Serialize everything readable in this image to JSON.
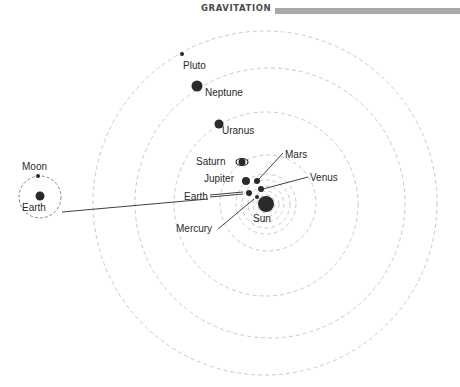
{
  "header": {
    "title": "GRAVITATION"
  },
  "diagram": {
    "sun": {
      "label": "Sun",
      "cx": 266,
      "cy": 204,
      "r": 8
    },
    "orbits": [
      {
        "name": "mercury-orbit",
        "cx": 266,
        "cy": 204,
        "r": 9
      },
      {
        "name": "venus-orbit",
        "cx": 266,
        "cy": 204,
        "r": 13
      },
      {
        "name": "earth-orbit",
        "cx": 266,
        "cy": 204,
        "r": 18
      },
      {
        "name": "mars-orbit",
        "cx": 266,
        "cy": 204,
        "r": 24
      },
      {
        "name": "jupiter-orbit",
        "cx": 266,
        "cy": 204,
        "r": 30
      },
      {
        "name": "saturn-orbit",
        "cx": 268,
        "cy": 203,
        "r": 48
      },
      {
        "name": "uranus-orbit",
        "cx": 266,
        "cy": 204,
        "r": 92
      },
      {
        "name": "neptune-orbit",
        "cx": 270,
        "cy": 203,
        "r": 135
      },
      {
        "name": "pluto-orbit",
        "cx": 265,
        "cy": 203,
        "r": 172
      }
    ],
    "planets": [
      {
        "label": "Mercury",
        "cx": 257,
        "cy": 197,
        "r": 2
      },
      {
        "label": "Venus",
        "cx": 261,
        "cy": 189,
        "r": 3
      },
      {
        "label": "Earth",
        "cx": 249,
        "cy": 193,
        "r": 3
      },
      {
        "label": "Mars",
        "cx": 257,
        "cy": 181,
        "r": 3
      },
      {
        "label": "Jupiter",
        "cx": 247,
        "cy": 181,
        "r": 4
      },
      {
        "label": "Saturn",
        "cx": 242,
        "cy": 162,
        "r": 4
      },
      {
        "label": "Uranus",
        "cx": 219,
        "cy": 124,
        "r": 4
      },
      {
        "label": "Neptune",
        "cx": 197,
        "cy": 86,
        "r": 5
      },
      {
        "label": "Pluto",
        "cx": 182,
        "cy": 54,
        "r": 2
      }
    ],
    "inset": {
      "earth_label": "Earth",
      "moon_label": "Moon",
      "center": {
        "cx": 40,
        "cy": 197
      },
      "orbit_r": 21
    },
    "labels": {
      "pluto": "Pluto",
      "neptune": "Neptune",
      "uranus": "Uranus",
      "saturn": "Saturn",
      "jupiter": "Jupiter",
      "mars": "Mars",
      "venus": "Venus",
      "earth": "Earth",
      "mercury": "Mercury",
      "sun": "Sun",
      "moon": "Moon",
      "inset_earth": "Earth"
    }
  }
}
